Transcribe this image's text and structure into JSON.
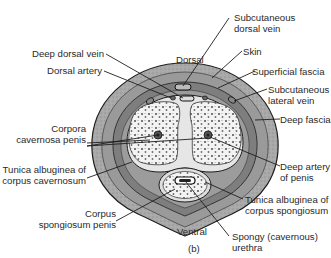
{
  "figure": {
    "panel_label": "(b)",
    "orientation": {
      "top": "Dorsal",
      "bottom": "Ventral"
    }
  },
  "labels": {
    "subcutaneous_dorsal_vein": [
      "Subcutaneous",
      "dorsal vein"
    ],
    "skin": "Skin",
    "superficial_fascia": "Superficial fascia",
    "subcutaneous_lateral_vein": [
      "Subcutaneous",
      "lateral vein"
    ],
    "deep_fascia": "Deep fascia",
    "deep_artery": [
      "Deep artery",
      "of penis"
    ],
    "tunica_spongiosum": [
      "Tunica albuginea of",
      "corpus spongiosum"
    ],
    "spongy_urethra": [
      "Spongy (cavernous)",
      "urethra"
    ],
    "deep_dorsal_vein": "Deep dorsal vein",
    "dorsal_artery": "Dorsal artery",
    "corpora_cavernosa": [
      "Corpora",
      "cavernosa penis"
    ],
    "tunica_cavernosum": [
      "Tunica albuginea of",
      "corpus cavernosum"
    ],
    "corpus_spongiosum": [
      "Corpus",
      "spongiosum penis"
    ]
  },
  "colors": {
    "skin": "#8c8c8c",
    "superficial_fascia": "#a8a8a8",
    "deep_fascia": "#7a7a7a",
    "tunica": "#e4e4e4",
    "erectile_tissue": "#f2f2f2",
    "outline": "#1e1e1e",
    "text": "#2a2a2a"
  }
}
